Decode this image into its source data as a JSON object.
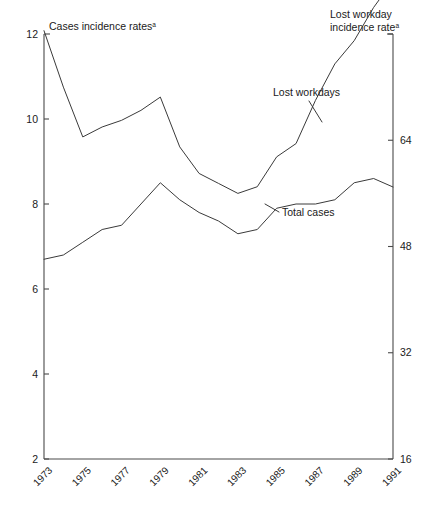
{
  "chart_data": {
    "type": "line",
    "title": "",
    "subtitle": "",
    "xlabel": "",
    "ylabel": "Cases incidence rates",
    "y2label": "Lost workday incidence rate",
    "left_axis_title": "Cases incidence rates",
    "left_axis_title_superscript": "a",
    "right_axis_title_line1": "Lost workday",
    "right_axis_title_line2": "incidence rate",
    "right_axis_title_superscript": "a",
    "grid": false,
    "legend_position": "inline-annotations",
    "x": [
      1973,
      1974,
      1975,
      1976,
      1977,
      1978,
      1979,
      1980,
      1981,
      1982,
      1983,
      1984,
      1985,
      1986,
      1987,
      1988,
      1989,
      1990,
      1991
    ],
    "xtick_labels": [
      "1973",
      "1975",
      "1977",
      "1979",
      "1981",
      "1983",
      "1985",
      "1987",
      "1989",
      "1991"
    ],
    "xtick_values": [
      1973,
      1975,
      1977,
      1979,
      1981,
      1983,
      1985,
      1987,
      1989,
      1991
    ],
    "xlim": [
      1973,
      1991
    ],
    "ylim": [
      2,
      12
    ],
    "ytick_labels": [
      "2",
      "4",
      "6",
      "8",
      "10",
      "12"
    ],
    "ytick_values": [
      2,
      4,
      6,
      8,
      10,
      12
    ],
    "y2lim": [
      16,
      80
    ],
    "y2tick_labels": [
      "16",
      "32",
      "48",
      "64",
      ""
    ],
    "y2tick_values": [
      16,
      32,
      48,
      64,
      80
    ],
    "series": [
      {
        "name": "Total cases",
        "axis": "left",
        "annotation": "Total cases",
        "values": [
          6.7,
          6.8,
          7.1,
          7.4,
          7.5,
          8.0,
          8.5,
          8.1,
          7.8,
          7.6,
          7.3,
          7.4,
          7.9,
          8.0,
          8.0,
          8.1,
          8.5,
          8.6,
          8.4
        ]
      },
      {
        "name": "Lost workdays",
        "axis": "right",
        "annotation": "Lost workdays",
        "values": [
          80.5,
          72.0,
          64.5,
          66.0,
          67.0,
          68.5,
          70.5,
          63.0,
          59.0,
          57.5,
          56.0,
          57.0,
          61.5,
          63.5,
          70.0,
          75.5,
          79.0,
          84.0,
          88.0
        ]
      }
    ]
  }
}
